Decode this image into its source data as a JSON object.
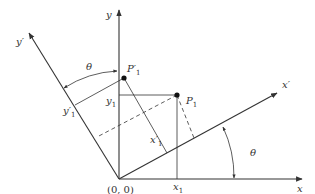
{
  "diagram": {
    "axes": {
      "x": {
        "label": "x"
      },
      "y": {
        "label": "y"
      },
      "x_prime": {
        "label": "x′"
      },
      "y_prime": {
        "label": "y′"
      }
    },
    "origin_label": "(0, 0)",
    "points": {
      "P1": {
        "label": "P",
        "sub": "1"
      },
      "P_prime_1": {
        "label": "P′",
        "sub": "1"
      }
    },
    "coordinate_labels": {
      "x1": {
        "label": "x",
        "sub": "1"
      },
      "y1": {
        "label": "y",
        "sub": "1"
      },
      "x_prime_1": {
        "label": "x′",
        "sub": "1"
      },
      "y_prime_1": {
        "label": "y′",
        "sub": "1"
      }
    },
    "angles": {
      "theta_top": "θ",
      "theta_right": "θ"
    },
    "colors": {
      "line": "#333333",
      "background": "#ffffff"
    }
  }
}
